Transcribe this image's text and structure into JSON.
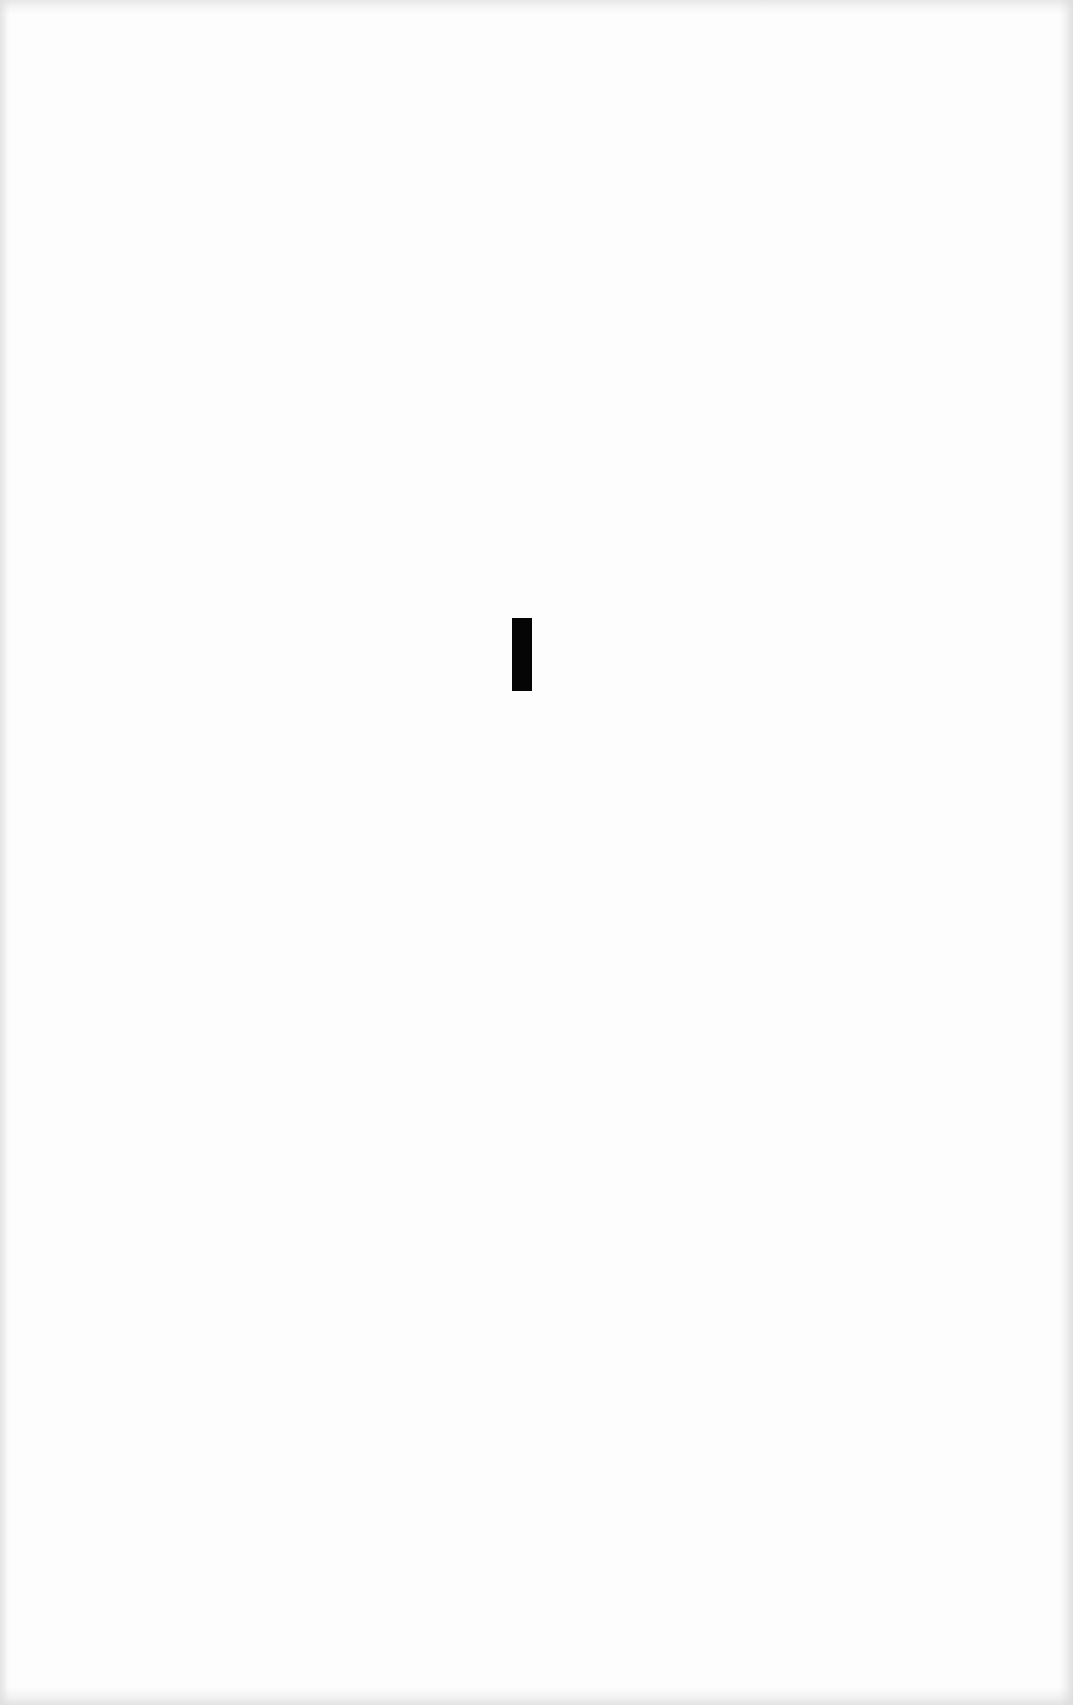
{
  "page": {
    "type": "scanned-page",
    "background_color": "#fdfdfd",
    "part_mark": {
      "text": "I",
      "color": "#050505"
    }
  }
}
